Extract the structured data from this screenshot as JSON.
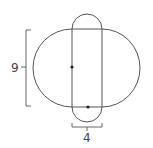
{
  "diagram": {
    "labels": {
      "height": "9",
      "width": "4"
    },
    "shapes": {
      "large_oval": {
        "type": "stadium-horizontal",
        "height_label": "9"
      },
      "vertical_capsule": {
        "type": "stadium-vertical",
        "width_label": "4"
      }
    },
    "points": [
      {
        "name": "center-left-dot",
        "description": "dot on left edge of rectangle, at vertical center of oval"
      },
      {
        "name": "bottom-center-dot",
        "description": "dot at bottom edge of rectangle, midpoint of width"
      }
    ],
    "colors": {
      "stroke": "#555555",
      "dot": "#222222",
      "text": "#444444"
    }
  }
}
